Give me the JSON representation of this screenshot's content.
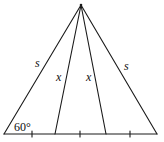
{
  "diagram": {
    "type": "triangle-with-cevians",
    "apex": [
      81,
      5
    ],
    "base_left": [
      4,
      134
    ],
    "base_right": [
      157,
      134
    ],
    "cevian_feet": [
      [
        55,
        134
      ],
      [
        106,
        134
      ]
    ],
    "tick_marks_x": [
      32,
      80,
      130
    ],
    "labels": {
      "left_side": "s",
      "right_side": "s",
      "left_cevian": "x",
      "right_cevian": "x",
      "base_angle": "60°"
    },
    "stroke_color": "#1a1a1a"
  }
}
